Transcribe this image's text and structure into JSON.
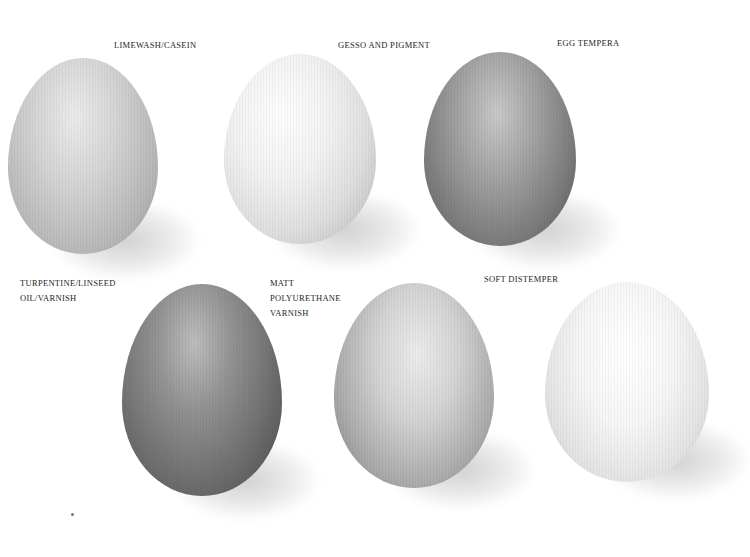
{
  "image": {
    "background": "#ffffff",
    "description": "Seven eggs on white background each showing a different paint finish"
  },
  "eggs": [
    {
      "label": "LIMEWASH/CASEIN",
      "tone": "light grey, speckled",
      "base": "#c9c9c9",
      "light": "#ececec",
      "dark": "#9c9c9c"
    },
    {
      "label": "GESSO AND PIGMENT",
      "tone": "very light, chalky",
      "base": "#e4e4e4",
      "light": "#fbfbfb",
      "dark": "#b8b8b8"
    },
    {
      "label": "EGG TEMPERA",
      "tone": "mid-dark grey, scratched",
      "base": "#8e8e8e",
      "light": "#c4c4c4",
      "dark": "#5a5a5a"
    },
    {
      "label_lines": [
        "TURPENTINE/LINSEED",
        "OIL/VARNISH"
      ],
      "tone": "dark grey, streaked",
      "base": "#7a7a7a",
      "light": "#b5b5b5",
      "dark": "#4a4a4a"
    },
    {
      "label_lines": [
        "MATT",
        "POLYURETHANE",
        "VARNISH"
      ],
      "tone": "light grey, mottled",
      "base": "#bdbdbd",
      "light": "#e8e8e8",
      "dark": "#8a8a8a"
    },
    {
      "label": "SOFT DISTEMPER",
      "tone": "near white, smooth",
      "base": "#ededed",
      "light": "#ffffff",
      "dark": "#cfcfcf"
    }
  ]
}
